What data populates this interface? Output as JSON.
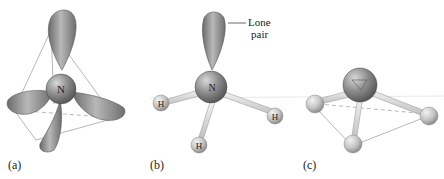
{
  "panels": [
    {
      "id": "a",
      "label": "(a)",
      "description": "Nitrogen with four sp3 hybrid orbitals in a tetrahedral arrangement",
      "central_atom": "N"
    },
    {
      "id": "b",
      "label": "(b)",
      "description": "Ammonia molecule: N with three H atoms and one lone pair",
      "central_atom": "N",
      "bonded_atoms": [
        "H",
        "H",
        "H"
      ],
      "annotation": {
        "line1": "Lone",
        "line2": "pair"
      }
    },
    {
      "id": "c",
      "label": "(c)",
      "description": "Trigonal pyramidal molecular geometry of ammonia"
    }
  ],
  "colors": {
    "orbital": "#8a8a8a",
    "nitrogen": "#7a7a7a",
    "hydrogen": "#c4c4c4",
    "edge": "#b5b5b5"
  }
}
